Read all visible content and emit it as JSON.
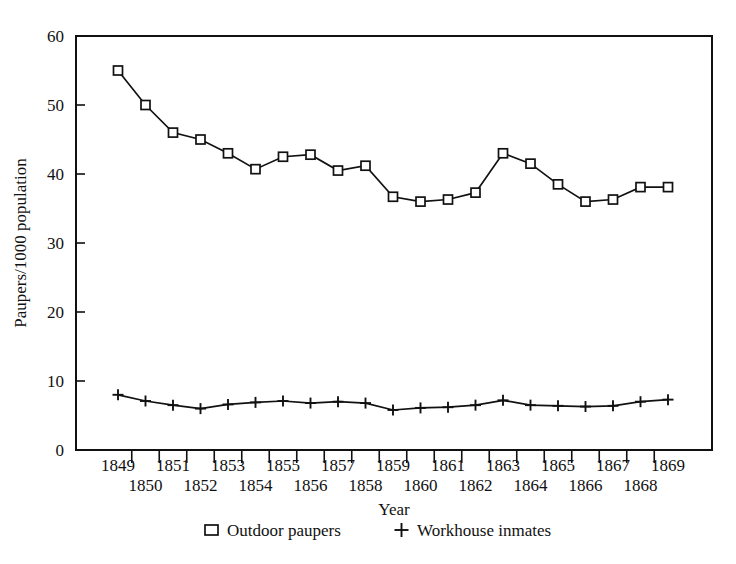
{
  "chart_data": {
    "type": "line",
    "title": "",
    "xlabel": "Year",
    "ylabel": "Paupers/1000 population",
    "xlim": [
      1849,
      1869
    ],
    "ylim": [
      0,
      60
    ],
    "grid": false,
    "legend_position": "bottom",
    "x": [
      1849,
      1850,
      1851,
      1852,
      1853,
      1854,
      1855,
      1856,
      1857,
      1858,
      1859,
      1860,
      1861,
      1862,
      1863,
      1864,
      1865,
      1866,
      1867,
      1868,
      1869
    ],
    "xtick_labels_top": [
      "1849",
      "",
      "1851",
      "",
      "1853",
      "",
      "1855",
      "",
      "1857",
      "",
      "1859",
      "",
      "1861",
      "",
      "1863",
      "",
      "1865",
      "",
      "1867",
      "",
      "1869"
    ],
    "xtick_labels_bottom": [
      "",
      "1850",
      "",
      "1852",
      "",
      "1854",
      "",
      "1856",
      "",
      "1858",
      "",
      "1860",
      "",
      "1862",
      "",
      "1864",
      "",
      "1866",
      "",
      "1868",
      ""
    ],
    "ytick_labels": [
      "0",
      "10",
      "20",
      "30",
      "40",
      "50",
      "60"
    ],
    "yticks": [
      0,
      10,
      20,
      30,
      40,
      50,
      60
    ],
    "series": [
      {
        "name": "Outdoor paupers",
        "marker": "square",
        "values": [
          55.0,
          50.0,
          46.0,
          45.0,
          43.0,
          40.7,
          42.5,
          42.8,
          40.5,
          41.2,
          36.7,
          36.0,
          36.3,
          37.3,
          43.0,
          41.5,
          38.5,
          36.0,
          36.3,
          38.1,
          38.1
        ]
      },
      {
        "name": "Workhouse inmates",
        "marker": "plus",
        "values": [
          8.0,
          7.1,
          6.5,
          6.0,
          6.6,
          6.9,
          7.1,
          6.8,
          7.0,
          6.8,
          5.8,
          6.1,
          6.2,
          6.5,
          7.2,
          6.5,
          6.4,
          6.3,
          6.4,
          7.0,
          7.3
        ]
      }
    ]
  },
  "legend": {
    "items": [
      {
        "label": "Outdoor paupers",
        "marker": "square"
      },
      {
        "label": "Workhouse inmates",
        "marker": "plus"
      }
    ]
  },
  "axes": {
    "x_title": "Year",
    "y_title": "Paupers/1000 population"
  },
  "colors": {
    "ink": "#111111",
    "background": "#ffffff"
  }
}
